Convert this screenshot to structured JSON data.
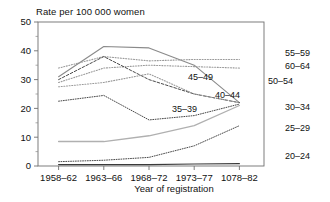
{
  "chart_data": {
    "type": "line",
    "title": "Rate per 100 000 women",
    "xlabel": "Year of registration",
    "ylabel": "Rate per 100 000 women",
    "categories": [
      "1958–62",
      "1963–66",
      "1968–72",
      "1973–77",
      "1078–82"
    ],
    "ylim": [
      0,
      50
    ],
    "yticks": [
      0,
      10,
      20,
      30,
      40,
      50
    ],
    "yticks_minor": [
      5,
      15,
      25,
      35,
      45
    ],
    "grid": false,
    "legend": "inline-labels",
    "series": [
      {
        "name": "50–54",
        "values": [
          31.0,
          41.5,
          41.0,
          35.0,
          22.0
        ],
        "color": "#8a8a8a",
        "style": "solid",
        "width": 1.1,
        "label_pos": "right",
        "label_x": 268,
        "label_y": 84
      },
      {
        "name": "55–59",
        "values": [
          34.0,
          38.0,
          36.5,
          37.0,
          37.0
        ],
        "color": "#9a9a9a",
        "style": "dotted",
        "width": 1.1,
        "label_pos": "right",
        "label_x": 285,
        "label_y": 56
      },
      {
        "name": "60–64",
        "values": [
          29.0,
          34.0,
          35.0,
          34.5,
          34.0
        ],
        "color": "#9a9a9a",
        "style": "dotted",
        "width": 1.1,
        "label_pos": "right",
        "label_x": 285,
        "label_y": 69
      },
      {
        "name": "45–49",
        "values": [
          30.0,
          38.0,
          30.0,
          25.0,
          22.0
        ],
        "color": "#4a4a4a",
        "style": "dashed",
        "width": 1.0,
        "label_pos": "inline",
        "label_x": 188,
        "label_y": 80
      },
      {
        "name": "40–44",
        "values": [
          27.5,
          29.0,
          32.0,
          25.0,
          22.0
        ],
        "color": "#9a9a9a",
        "style": "dotted",
        "width": 1.1,
        "label_pos": "inline",
        "label_x": 215,
        "label_y": 98
      },
      {
        "name": "35–39",
        "values": [
          22.5,
          24.5,
          16.0,
          17.5,
          21.5
        ],
        "color": "#4a4a4a",
        "style": "dotted",
        "width": 1.0,
        "label_pos": "inline",
        "label_x": 172,
        "label_y": 112
      },
      {
        "name": "30–34",
        "values": [
          8.5,
          8.5,
          10.5,
          14.0,
          21.0
        ],
        "color": "#b0b0b0",
        "style": "solid",
        "width": 1.3,
        "label_pos": "right",
        "label_x": 285,
        "label_y": 110
      },
      {
        "name": "25–29",
        "values": [
          1.5,
          2.0,
          3.0,
          7.0,
          14.0
        ],
        "color": "#4a4a4a",
        "style": "dotted",
        "width": 1.0,
        "label_pos": "right",
        "label_x": 285,
        "label_y": 131
      },
      {
        "name": "20–24",
        "values": [
          0.5,
          0.5,
          0.5,
          0.7,
          0.8
        ],
        "color": "#3a3a3a",
        "style": "solid",
        "width": 1.2,
        "label_pos": "right",
        "label_x": 285,
        "label_y": 159
      }
    ]
  }
}
